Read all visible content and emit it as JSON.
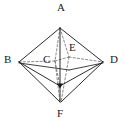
{
  "figure": {
    "kind": "geometry-diagram",
    "name": "octahedron",
    "background_color": "#ffffff",
    "stroke_color": "#2b2b2b",
    "hidden_stroke_color": "#6d6d6d",
    "vertex_dot_color": "#1a1a1a",
    "labels": [
      {
        "id": "A",
        "text": "A",
        "x": 57,
        "y": 2,
        "role": "top-apex-label"
      },
      {
        "id": "B",
        "text": "B",
        "x": 4,
        "y": 54,
        "role": "left-vertex-label"
      },
      {
        "id": "C",
        "text": "C",
        "x": 43,
        "y": 54,
        "role": "hidden-vertex-label"
      },
      {
        "id": "E",
        "text": "E",
        "x": 69,
        "y": 42,
        "role": "hidden-vertex-label"
      },
      {
        "id": "D",
        "text": "D",
        "x": 110,
        "y": 54,
        "role": "right-vertex-label"
      },
      {
        "id": "F",
        "text": "F",
        "x": 57,
        "y": 108,
        "role": "bottom-apex-label"
      }
    ],
    "vertices": [
      {
        "id": "A",
        "x": 60,
        "y": 27,
        "visible": true,
        "dot": false
      },
      {
        "id": "B",
        "x": 18,
        "y": 62,
        "visible": true,
        "dot": false
      },
      {
        "id": "C",
        "x": 55,
        "y": 61,
        "visible": false,
        "dot": false
      },
      {
        "id": "E",
        "x": 69,
        "y": 57,
        "visible": false,
        "dot": false
      },
      {
        "id": "D",
        "x": 104,
        "y": 62,
        "visible": true,
        "dot": false
      },
      {
        "id": "F",
        "x": 60,
        "y": 103,
        "visible": true,
        "dot": false
      },
      {
        "id": "G",
        "x": 60,
        "y": 86,
        "visible": true,
        "dot": true
      }
    ],
    "solid_edges": [
      [
        "A",
        "B"
      ],
      [
        "A",
        "D"
      ],
      [
        "A",
        "G"
      ],
      [
        "B",
        "G"
      ],
      [
        "D",
        "G"
      ],
      [
        "B",
        "F"
      ],
      [
        "D",
        "F"
      ],
      [
        "G",
        "F"
      ],
      [
        "B",
        "E"
      ],
      [
        "E",
        "D"
      ]
    ],
    "dashed_edges": [
      [
        "B",
        "C"
      ],
      [
        "C",
        "E"
      ],
      [
        "E",
        "D"
      ],
      [
        "A",
        "C"
      ],
      [
        "C",
        "F"
      ],
      [
        "A",
        "E"
      ],
      [
        "E",
        "F"
      ],
      [
        "C",
        "G"
      ]
    ]
  }
}
